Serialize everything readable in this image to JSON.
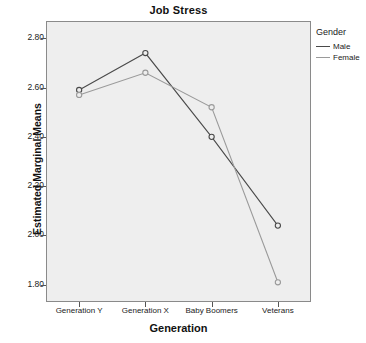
{
  "chart_data": {
    "type": "line",
    "title": "Job Stress",
    "xlabel": "Generation",
    "ylabel": "Estimated Marginal Means",
    "categories": [
      "Generation Y",
      "Generation X",
      "Baby Boomers",
      "Veterans"
    ],
    "series": [
      {
        "name": "Male",
        "values": [
          2.59,
          2.74,
          2.4,
          2.04
        ],
        "color": "#4a4a4a"
      },
      {
        "name": "Female",
        "values": [
          2.57,
          2.66,
          2.52,
          1.81
        ],
        "color": "#9a9a9a"
      }
    ],
    "ylim": [
      1.73,
      2.87
    ],
    "yticks": [
      2.8,
      2.6,
      2.4,
      2.2,
      2.0,
      1.8
    ],
    "ytick_labels": [
      "2.80",
      "2.60",
      "2.40",
      "2.20",
      "2.00",
      "1.80"
    ],
    "grid": false,
    "legend": {
      "title": "Gender",
      "position": "right",
      "entries": [
        "Male",
        "Female"
      ]
    },
    "marker": "open-circle",
    "plot_background": "#eeeeee"
  }
}
